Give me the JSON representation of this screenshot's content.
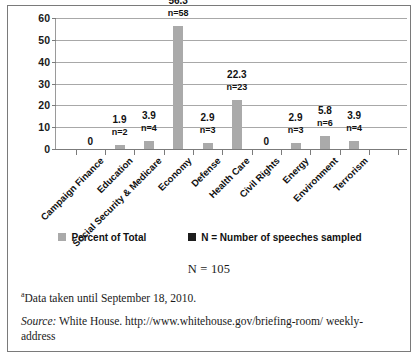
{
  "chart_data": {
    "type": "bar",
    "title": "",
    "xlabel": "",
    "ylabel": "",
    "ylim": [
      0,
      60
    ],
    "yticks": [
      0,
      10,
      20,
      30,
      40,
      50,
      60
    ],
    "grid": true,
    "legend_position": "bottom",
    "categories": [
      "Campaign Finance",
      "Education",
      "Social Security & Medicare",
      "Economy",
      "Defense",
      "Health Care",
      "Civil Rights",
      "Energy",
      "Environment",
      "Terrorism"
    ],
    "series": [
      {
        "name": "Percent of Total",
        "values": [
          0,
          1.9,
          3.9,
          56.3,
          2.9,
          22.3,
          0,
          2.9,
          5.8,
          3.9
        ]
      }
    ],
    "point_labels": [
      "0",
      "1.9",
      "3.9",
      "56.3",
      "2.9",
      "22.3",
      "0",
      "2.9",
      "5.8",
      "3.9"
    ],
    "n_labels": [
      "",
      "n=2",
      "n=4",
      "n=58",
      "n=3",
      "n=23",
      "",
      "n=3",
      "n=6",
      "n=4"
    ],
    "n_values": [
      0,
      2,
      4,
      58,
      3,
      23,
      0,
      3,
      6,
      4
    ],
    "legend": [
      {
        "label": "Percent of Total",
        "color": "#aaaaaa"
      },
      {
        "label": "N = Number of speeches sampled",
        "color": "#1d1d1d"
      }
    ],
    "total_annotation": "N = 105"
  },
  "notes": {
    "footnote_marker": "a",
    "footnote_text": "Data taken until September 18, 2010.",
    "source_label": "Source:",
    "source_text": "White House. http://www.whitehouse.gov/briefing-room/ weekly-address"
  },
  "colors": {
    "bar": "#aaaaaa",
    "legend_black": "#1d1d1d",
    "gridline": "#a8a8a8",
    "axis": "#7b7b7b",
    "frame": "#7a7a7a"
  }
}
